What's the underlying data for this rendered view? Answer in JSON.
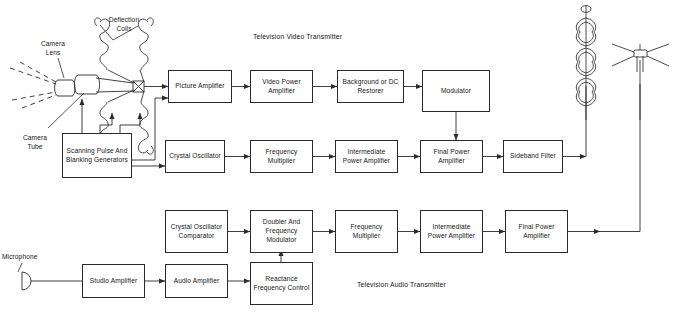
{
  "diagram": {
    "titles": {
      "video": "Television Video Transmitter",
      "audio": "Television Audio Transmitter"
    },
    "annotations": {
      "deflection_coils": "Deflection\nCoils",
      "camera_lens": "Camera\nLens",
      "camera_tube": "Camera\nTube",
      "microphone": "Microphone"
    },
    "blocks": {
      "scanning_pulse": "Scanning Pulse\nAnd Blanking\nGenerators",
      "picture_amplifier": "Picture\nAmplifier",
      "video_power_amplifier": "Video Power\nAmplifier",
      "background_dc_restorer": "Background\nor DC Restorer",
      "modulator": "Modulator",
      "crystal_oscillator": "Crystal\nOscillator",
      "frequency_multiplier_video": "Frequency\nMultiplier",
      "intermediate_power_amplifier_video": "Intermediate\nPower Amplifier",
      "final_power_amplifier_video": "Final Power\nAmplifier",
      "sideband_filter": "Sideband\nFilter",
      "crystal_oscillator_comparator": "Crystal\nOscillator\nComparator",
      "doubler_frequency_modulator": "Doubler And\nFrequency\nModulator",
      "frequency_multiplier_audio": "Frequency\nMultiplier",
      "intermediate_power_amplifier_audio": "Intermediate\nPower\nAmplifier",
      "final_power_amplifier_audio": "Final Power\nAmplifier",
      "studio_amplifier": "Studio\nAmplifier",
      "audio_amplifier": "Audio\nAmplifier",
      "reactance_frequency_control": "Reactance\nFrequency\nControl"
    },
    "colors": {
      "line": "#2b2b2b",
      "background": "#ffffff",
      "text": "#161616"
    }
  }
}
